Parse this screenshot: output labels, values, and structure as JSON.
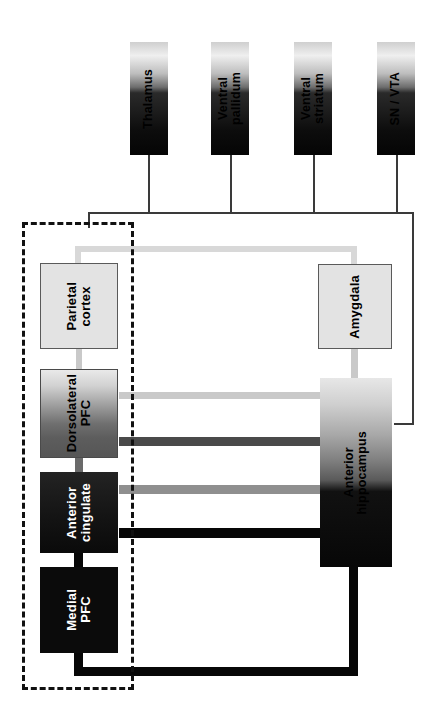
{
  "diagram": {
    "orientation": "rotated-90",
    "nodes": {
      "thalamus": {
        "label": "Thalamus",
        "group": "subcortical"
      },
      "ventral_pallidum": {
        "label": "Ventral\npallidum",
        "group": "subcortical"
      },
      "ventral_striatum": {
        "label": "Ventral\nstriatum",
        "group": "subcortical"
      },
      "sn_vta": {
        "label": "SN / VTA",
        "group": "subcortical"
      },
      "parietal_cortex": {
        "label": "Parietal\ncortex",
        "group": "cortical"
      },
      "dorsolateral_pfc": {
        "label": "Dorsolateral\nPFC",
        "group": "cortical"
      },
      "anterior_cingulate": {
        "label": "Anterior\ncingulate",
        "group": "cortical"
      },
      "medial_pfc": {
        "label": "Medial\nPFC",
        "group": "cortical"
      },
      "amygdala": {
        "label": "Amygdala",
        "group": "limbic"
      },
      "anterior_hippocampus": {
        "label": "Anterior\nhippocampus",
        "group": "limbic"
      }
    },
    "colors": {
      "edge_thin": "#3a3a3a",
      "edge_very_light": "#d8d8d8",
      "edge_light": "#c9c9c9",
      "edge_mid": "#8f8f8f",
      "edge_dark": "#4a4a4a",
      "edge_black": "#070707",
      "group_frame": "#111111",
      "node_light_fill": "#e3e3e3",
      "node_dark_fill": "#0b0b0b"
    }
  }
}
